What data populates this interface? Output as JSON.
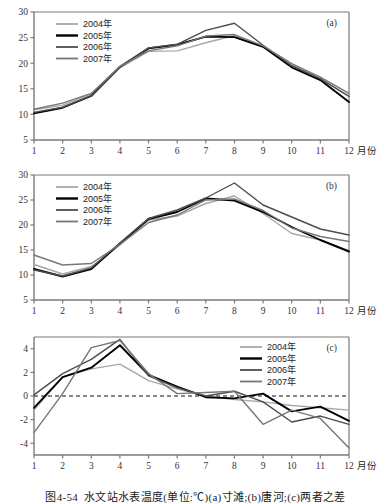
{
  "figure": {
    "caption_number": "图4-54",
    "caption_text": "水文站水表温度(单位:℃)(a)寸滩;(b)唐河;(c)两者之差",
    "axis_x_label": "月份",
    "series_colors": {
      "2004": "#a8a8a8",
      "2005": "#000000",
      "2006": "#4d4d4d",
      "2007": "#777777"
    }
  },
  "chart_data": [
    {
      "type": "line",
      "panel_label": "(a)",
      "title": "寸滩",
      "xlabel": "月份",
      "ylabel": "",
      "categories": [
        1,
        2,
        3,
        4,
        5,
        6,
        7,
        8,
        9,
        10,
        11,
        12
      ],
      "xlim": [
        1,
        12
      ],
      "ylim": [
        5,
        30
      ],
      "yticks": [
        5,
        10,
        15,
        20,
        25,
        30
      ],
      "xticks": [
        1,
        2,
        3,
        4,
        5,
        6,
        7,
        8,
        9,
        10,
        11,
        12
      ],
      "grid": false,
      "legend_position": "top-left",
      "series": [
        {
          "name": "2004年",
          "color": "#a8a8a8",
          "values": [
            10.9,
            11.8,
            14.0,
            19.1,
            22.3,
            22.4,
            24.0,
            25.4,
            23.3,
            19.6,
            16.9,
            13.6
          ]
        },
        {
          "name": "2005年",
          "color": "#000000",
          "values": [
            10.2,
            11.3,
            13.6,
            19.3,
            22.9,
            23.6,
            25.2,
            25.1,
            23.2,
            19.2,
            16.7,
            12.4
          ]
        },
        {
          "name": "2006年",
          "color": "#4d4d4d",
          "values": [
            10.4,
            11.4,
            13.6,
            19.2,
            23.0,
            23.7,
            26.4,
            27.8,
            23.5,
            19.5,
            17.0,
            13.5
          ]
        },
        {
          "name": "2007年",
          "color": "#777777",
          "values": [
            11.0,
            12.2,
            14.1,
            19.4,
            22.4,
            23.4,
            25.3,
            25.6,
            23.4,
            19.9,
            17.3,
            14.1
          ]
        }
      ]
    },
    {
      "type": "line",
      "panel_label": "(b)",
      "title": "唐河",
      "xlabel": "月份",
      "ylabel": "",
      "categories": [
        1,
        2,
        3,
        4,
        5,
        6,
        7,
        8,
        9,
        10,
        11,
        12
      ],
      "xlim": [
        1,
        12
      ],
      "ylim": [
        5,
        30
      ],
      "yticks": [
        5,
        10,
        15,
        20,
        25,
        30
      ],
      "xticks": [
        1,
        2,
        3,
        4,
        5,
        6,
        7,
        8,
        9,
        10,
        11,
        12
      ],
      "grid": false,
      "legend_position": "top-left",
      "series": [
        {
          "name": "2004年",
          "color": "#a8a8a8",
          "values": [
            12.1,
            10.2,
            11.7,
            16.0,
            21.0,
            21.8,
            24.3,
            25.8,
            22.3,
            18.3,
            17.0,
            14.8
          ]
        },
        {
          "name": "2005年",
          "color": "#000000",
          "values": [
            11.2,
            9.7,
            11.2,
            16.3,
            21.2,
            22.6,
            25.3,
            24.9,
            22.6,
            19.6,
            17.0,
            14.7
          ]
        },
        {
          "name": "2006年",
          "color": "#4d4d4d",
          "values": [
            11.0,
            9.8,
            11.4,
            16.4,
            21.3,
            23.0,
            25.4,
            28.4,
            24.0,
            21.6,
            19.2,
            18.0
          ]
        },
        {
          "name": "2007年",
          "color": "#777777",
          "values": [
            14.0,
            12.0,
            12.3,
            16.1,
            20.5,
            22.0,
            25.0,
            25.2,
            22.9,
            19.4,
            17.7,
            16.7
          ]
        }
      ]
    },
    {
      "type": "line",
      "panel_label": "(c)",
      "title": "两者之差",
      "xlabel": "月份",
      "ylabel": "",
      "categories": [
        1,
        2,
        3,
        4,
        5,
        6,
        7,
        8,
        9,
        10,
        11,
        12
      ],
      "xlim": [
        1,
        12
      ],
      "ylim": [
        -5,
        5
      ],
      "yticks": [
        -4,
        -2,
        0,
        2,
        4
      ],
      "xticks": [
        1,
        2,
        3,
        4,
        5,
        6,
        7,
        8,
        9,
        10,
        11,
        12
      ],
      "grid": false,
      "zero_line": 0,
      "legend_position": "top-right",
      "series": [
        {
          "name": "2004年",
          "color": "#a8a8a8",
          "values": [
            -1.2,
            1.6,
            2.3,
            2.7,
            1.3,
            0.6,
            0.0,
            -0.3,
            -0.5,
            -0.8,
            -1.0,
            -1.2
          ]
        },
        {
          "name": "2005年",
          "color": "#000000",
          "values": [
            -1.0,
            1.6,
            2.4,
            4.3,
            1.8,
            0.8,
            -0.1,
            -0.2,
            0.2,
            -1.3,
            -0.9,
            -2.1
          ]
        },
        {
          "name": "2006年",
          "color": "#4d4d4d",
          "values": [
            0.1,
            1.9,
            3.1,
            4.8,
            1.7,
            0.7,
            0.0,
            0.4,
            -0.5,
            -2.2,
            -1.7,
            -2.4
          ]
        },
        {
          "name": "2007年",
          "color": "#777777",
          "values": [
            -3.1,
            0.2,
            4.1,
            4.7,
            1.9,
            0.2,
            0.3,
            0.4,
            -2.4,
            -1.2,
            -1.9,
            -4.4
          ]
        }
      ]
    }
  ]
}
